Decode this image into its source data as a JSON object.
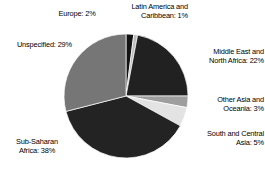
{
  "chart_data": {
    "type": "pie",
    "title": "",
    "subtitle": "",
    "xlabel": "",
    "ylabel": "",
    "legend_position": "outside-labels",
    "grid": false,
    "unit": "%",
    "categories": [
      "Europe",
      "Latin America and Caribbean",
      "Middle East and North Africa",
      "Other Asia and Oceania",
      "South and Central Asia",
      "Sub-Saharan Africa",
      "Unspecified"
    ],
    "values": [
      2,
      1,
      22,
      3,
      5,
      38,
      29
    ],
    "slices": [
      {
        "name": "europe",
        "label": "Europe: 2%",
        "label_name": "Europe",
        "value": 2,
        "value_text": "2%",
        "color": "#141414",
        "start_angle": 0,
        "end_angle": 7.2
      },
      {
        "name": "latin-america-caribbean",
        "label": "Latin America and\nCaribbean: 1%",
        "label_name": "Latin America and Caribbean",
        "value": 1,
        "value_text": "1%",
        "color": "#bdbdbd",
        "start_angle": 7.2,
        "end_angle": 10.8
      },
      {
        "name": "middle-east-north-africa",
        "label": "Middle East and\nNorth Africa: 22%",
        "label_name": "Middle East and North Africa",
        "value": 22,
        "value_text": "22%",
        "color": "#212121",
        "start_angle": 10.8,
        "end_angle": 90.0
      },
      {
        "name": "other-asia-oceania",
        "label": "Other Asia and\nOceania: 3%",
        "label_name": "Other Asia and Oceania",
        "value": 3,
        "value_text": "3%",
        "color": "#9e9e9e",
        "start_angle": 90.0,
        "end_angle": 100.8
      },
      {
        "name": "south-central-asia",
        "label": "South and Central\nAsia: 5%",
        "label_name": "South and Central Asia",
        "value": 5,
        "value_text": "5%",
        "color": "#e3e3e3",
        "start_angle": 100.8,
        "end_angle": 118.8
      },
      {
        "name": "sub-saharan-africa",
        "label": "Sub-Saharan\nAfrica: 38%",
        "label_name": "Sub-Saharan Africa",
        "value": 38,
        "value_text": "38%",
        "color": "#232323",
        "start_angle": 118.8,
        "end_angle": 255.6
      },
      {
        "name": "unspecified",
        "label": "Unspecified: 29%",
        "label_name": "Unspecified",
        "value": 29,
        "value_text": "29%",
        "color": "#767676",
        "start_angle": 255.6,
        "end_angle": 360
      }
    ],
    "geometry": {
      "center_x": 126,
      "center_y": 96,
      "radius": 62
    },
    "colors": {
      "background": "#ffffff",
      "text": "#000000",
      "dark": "#212121",
      "mid_gray": "#767676",
      "light_gray": "#bdbdbd",
      "pale_gray": "#e3e3e3"
    }
  }
}
